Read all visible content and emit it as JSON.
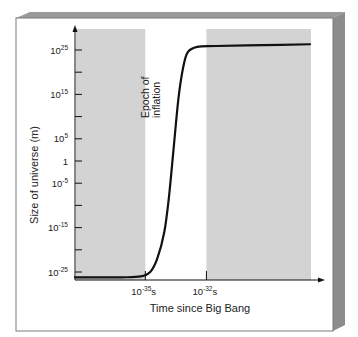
{
  "chart_data": {
    "type": "line",
    "title": "",
    "xlabel": "Time since Big Bang",
    "ylabel": "Size of universe (m)",
    "y_scale": "log10",
    "ylim_exponent": [
      -27,
      29
    ],
    "y_ticks": [
      {
        "exp": 25,
        "label_base": "10",
        "label_sup": "25"
      },
      {
        "exp": 20,
        "label_base": "",
        "label_sup": ""
      },
      {
        "exp": 15,
        "label_base": "10",
        "label_sup": "15"
      },
      {
        "exp": 10,
        "label_base": "",
        "label_sup": ""
      },
      {
        "exp": 5,
        "label_base": "10",
        "label_sup": "5"
      },
      {
        "exp": 0,
        "label_base": "1",
        "label_sup": ""
      },
      {
        "exp": -5,
        "label_base": "10",
        "label_sup": "-5"
      },
      {
        "exp": -10,
        "label_base": "",
        "label_sup": ""
      },
      {
        "exp": -15,
        "label_base": "10",
        "label_sup": "-15"
      },
      {
        "exp": -20,
        "label_base": "",
        "label_sup": ""
      },
      {
        "exp": -25,
        "label_base": "10",
        "label_sup": "-25"
      }
    ],
    "x_ticks": [
      {
        "pos": 0.295,
        "label_base": "10",
        "label_sup": "-35",
        "label_unit": "s"
      },
      {
        "pos": 0.555,
        "label_base": "10",
        "label_sup": "-32",
        "label_unit": "s"
      }
    ],
    "shaded_regions": [
      {
        "from": 0.0,
        "to": 0.295,
        "label": "before inflation"
      },
      {
        "from": 0.555,
        "to": 1.0,
        "label": "after inflation"
      }
    ],
    "annotation": {
      "text_line1": "Epoch of",
      "text_line2": "inflation",
      "orientation": "vertical"
    },
    "series": [
      {
        "name": "Size of universe",
        "points_normx_logy": [
          [
            0.0,
            -26.2
          ],
          [
            0.2,
            -26.2
          ],
          [
            0.28,
            -26.0
          ],
          [
            0.32,
            -25.0
          ],
          [
            0.35,
            -22.0
          ],
          [
            0.38,
            -16.0
          ],
          [
            0.4,
            -8.0
          ],
          [
            0.42,
            3.0
          ],
          [
            0.44,
            14.0
          ],
          [
            0.46,
            21.0
          ],
          [
            0.48,
            24.5
          ],
          [
            0.52,
            25.7
          ],
          [
            0.6,
            25.9
          ],
          [
            0.8,
            26.1
          ],
          [
            1.0,
            26.3
          ]
        ]
      }
    ],
    "colors": {
      "shade": "#d3d3d3",
      "line": "#111111",
      "frame": "#8a8a8a"
    }
  }
}
